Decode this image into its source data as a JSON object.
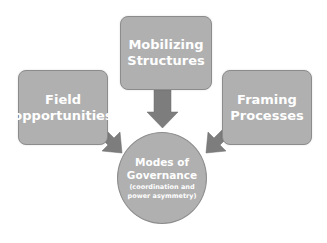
{
  "diagram": {
    "colors": {
      "box_fill": "#b0b0b0",
      "box_border": "#8c8c8c",
      "arrow_fill": "#7d7d7d",
      "text": "#ffffff",
      "background": "#ffffff"
    },
    "nodes": {
      "mobilizing": {
        "line1": "Mobilizing",
        "line2": "Structures"
      },
      "field": {
        "line1": "Field",
        "line2": "opportunities"
      },
      "framing": {
        "line1": "Framing",
        "line2": "Processes"
      },
      "governance": {
        "line1": "Modes of",
        "line2": "Governance",
        "sub1": "(coordination and",
        "sub2": "power asymmetry)"
      }
    },
    "edges": [
      {
        "from": "Mobilizing Structures",
        "to": "Modes of Governance"
      },
      {
        "from": "Field opportunities",
        "to": "Modes of Governance"
      },
      {
        "from": "Framing Processes",
        "to": "Modes of Governance"
      }
    ]
  }
}
